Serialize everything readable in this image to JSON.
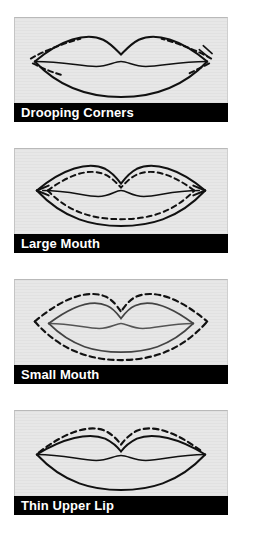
{
  "page": {
    "background_color": "#ffffff",
    "panel_fill_color": "#e7e7e7",
    "label_bar_color": "#000000",
    "label_text_color": "#ffffff",
    "ink_color": "#111111"
  },
  "panels": [
    {
      "label": "Drooping Corners",
      "figure": "lips-diagram",
      "solid_outline": "lip outline with downturned outer corners",
      "dashed_correction": "short dashed lines at both outer corners angled upward, lifting the corner line",
      "arrows": "none"
    },
    {
      "label": "Large Mouth",
      "figure": "lips-diagram",
      "solid_outline": "wide lip outline with arrowheads at left and right corners",
      "dashed_correction": "dashed line drawn inside the solid outline, all around upper and lower lip",
      "arrows": "left and right corner arrowheads pointing outward"
    },
    {
      "label": "Small Mouth",
      "figure": "lips-diagram",
      "solid_outline": "narrow lip outline",
      "dashed_correction": "dashed line drawn outside the solid outline, all around upper and lower lip",
      "arrows": "none"
    },
    {
      "label": "Thin Upper Lip",
      "figure": "lips-diagram",
      "solid_outline": "lip outline with a thin upper lip",
      "dashed_correction": "dashed line above the upper lip line only, adding fullness",
      "arrows": "none"
    }
  ]
}
